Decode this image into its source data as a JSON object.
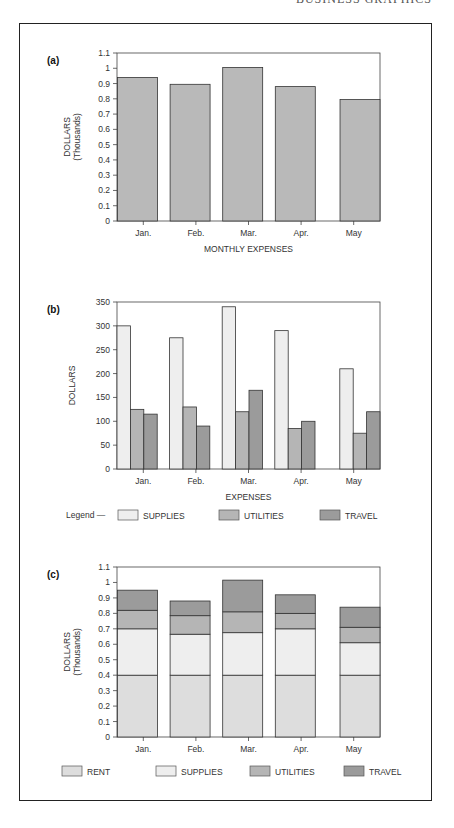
{
  "header": {
    "title": "BUSINESS GRAPHICS"
  },
  "colors": {
    "bar_a": "#b9b9b9",
    "rent": "#dddddd",
    "supplies": "#eeeeee",
    "utilities": "#b5b5b5",
    "travel": "#9b9b9b",
    "stroke": "#333333"
  },
  "chart_data": [
    {
      "panel": "(a)",
      "type": "bar",
      "title": "",
      "xlabel": "MONTHLY EXPENSES",
      "ylabel": "DOLLARS (Thousands)",
      "categories": [
        "Jan.",
        "Feb.",
        "Mar.",
        "Apr.",
        "May"
      ],
      "values": [
        0.94,
        0.895,
        1.005,
        0.88,
        0.795
      ],
      "ylim": [
        0,
        1.1
      ],
      "yticks": [
        "0",
        "0.1",
        "0.2",
        "0.3",
        "0.4",
        "0.5",
        "0.6",
        "0.7",
        "0.8",
        "0.9",
        "1",
        "1.1"
      ],
      "grid": false
    },
    {
      "panel": "(b)",
      "type": "bar",
      "title": "",
      "xlabel": "EXPENSES",
      "ylabel": "DOLLARS",
      "categories": [
        "Jan.",
        "Feb.",
        "Mar.",
        "Apr.",
        "May"
      ],
      "series": [
        {
          "name": "SUPPLIES",
          "values": [
            300,
            275,
            340,
            290,
            210
          ]
        },
        {
          "name": "UTILITIES",
          "values": [
            125,
            130,
            120,
            85,
            75
          ]
        },
        {
          "name": "TRAVEL",
          "values": [
            115,
            90,
            165,
            100,
            120
          ]
        }
      ],
      "ylim": [
        0,
        350
      ],
      "yticks": [
        "0",
        "50",
        "100",
        "150",
        "200",
        "250",
        "300",
        "350"
      ],
      "legend_prefix": "Legend —",
      "legend_position": "bottom",
      "grid": false
    },
    {
      "panel": "(c)",
      "type": "bar",
      "stacked": true,
      "title": "",
      "xlabel": "",
      "ylabel": "DOLLARS (Thousands)",
      "categories": [
        "Jan.",
        "Feb.",
        "Mar.",
        "Apr.",
        "May"
      ],
      "series": [
        {
          "name": "RENT",
          "values": [
            0.4,
            0.4,
            0.4,
            0.4,
            0.4
          ]
        },
        {
          "name": "SUPPLIES",
          "values": [
            0.3,
            0.265,
            0.275,
            0.3,
            0.21
          ]
        },
        {
          "name": "UTILITIES",
          "values": [
            0.12,
            0.12,
            0.135,
            0.1,
            0.1
          ]
        },
        {
          "name": "TRAVEL",
          "values": [
            0.13,
            0.095,
            0.205,
            0.12,
            0.13
          ]
        }
      ],
      "ylim": [
        0,
        1.1
      ],
      "yticks": [
        "0",
        "0.1",
        "0.2",
        "0.3",
        "0.4",
        "0.5",
        "0.6",
        "0.7",
        "0.8",
        "0.9",
        "1",
        "1.1"
      ],
      "legend_position": "bottom",
      "grid": false
    }
  ]
}
